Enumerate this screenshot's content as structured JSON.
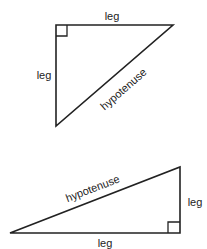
{
  "triangles": [
    {
      "name": "upper-triangle",
      "labels": {
        "top_leg": "leg",
        "left_leg": "leg",
        "hypotenuse": "hypotenuse"
      }
    },
    {
      "name": "lower-triangle",
      "labels": {
        "hypotenuse": "hypotenuse",
        "right_leg": "leg",
        "bottom_leg": "leg"
      }
    }
  ],
  "colors": {
    "stroke": "#222222",
    "background": "#ffffff"
  }
}
